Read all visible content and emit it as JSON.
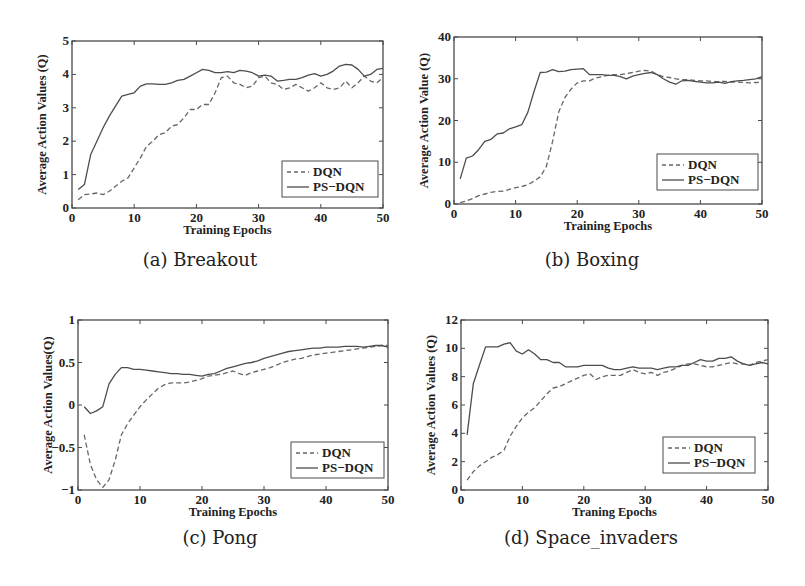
{
  "chart_data": [
    {
      "id": "a",
      "type": "line",
      "caption": "(a) Breakout",
      "title": "",
      "xlabel": "Training Epochs",
      "ylabel": "Average Action Values (Q)",
      "xlim": [
        0,
        50
      ],
      "ylim": [
        0,
        5
      ],
      "xticks": [
        0,
        10,
        20,
        30,
        40,
        50
      ],
      "yticks": [
        0,
        1,
        2,
        3,
        4,
        5
      ],
      "grid": false,
      "legend_position": "lower right",
      "frame": {
        "x": 72,
        "y": 41,
        "w": 311,
        "h": 167
      },
      "legend_box": {
        "x": 282,
        "y": 161,
        "w": 96,
        "h": 36
      },
      "x": [
        1,
        2,
        3,
        4,
        5,
        6,
        7,
        8,
        9,
        10,
        11,
        12,
        13,
        14,
        15,
        16,
        17,
        18,
        19,
        20,
        21,
        22,
        23,
        24,
        25,
        26,
        27,
        28,
        29,
        30,
        31,
        32,
        33,
        34,
        35,
        36,
        37,
        38,
        39,
        40,
        41,
        42,
        43,
        44,
        45,
        46,
        47,
        48,
        49,
        50
      ],
      "series": [
        {
          "name": "DQN",
          "style": "dashed",
          "values": [
            0.25,
            0.4,
            0.42,
            0.45,
            0.4,
            0.5,
            0.65,
            0.8,
            0.9,
            1.2,
            1.5,
            1.85,
            2.0,
            2.2,
            2.25,
            2.45,
            2.5,
            2.7,
            2.95,
            2.95,
            3.1,
            3.1,
            3.45,
            3.9,
            3.95,
            3.75,
            3.7,
            3.6,
            3.65,
            3.9,
            3.95,
            3.75,
            3.7,
            3.55,
            3.6,
            3.7,
            3.6,
            3.5,
            3.6,
            3.75,
            3.6,
            3.55,
            3.6,
            3.8,
            3.6,
            3.75,
            3.95,
            3.8,
            3.75,
            3.9
          ]
        },
        {
          "name": "PS-DQN",
          "style": "solid",
          "values": [
            0.55,
            0.7,
            1.6,
            2.0,
            2.4,
            2.75,
            3.05,
            3.35,
            3.4,
            3.45,
            3.65,
            3.72,
            3.72,
            3.7,
            3.7,
            3.75,
            3.82,
            3.85,
            3.95,
            4.05,
            4.15,
            4.12,
            4.05,
            4.05,
            4.08,
            4.05,
            4.12,
            4.1,
            4.05,
            3.95,
            3.98,
            3.95,
            3.8,
            3.82,
            3.85,
            3.85,
            3.9,
            3.98,
            4.02,
            3.95,
            4.0,
            4.1,
            4.25,
            4.3,
            4.28,
            4.15,
            3.95,
            4.0,
            4.15,
            4.18
          ]
        }
      ]
    },
    {
      "id": "b",
      "type": "line",
      "caption": "(b) Boxing",
      "title": "",
      "xlabel": "Training Epochs",
      "ylabel": "Average Action Value (Q)",
      "xlim": [
        0,
        50
      ],
      "ylim": [
        0,
        40
      ],
      "xticks": [
        0,
        10,
        20,
        30,
        40,
        50
      ],
      "yticks": [
        0,
        10,
        20,
        30,
        40
      ],
      "grid": false,
      "legend_position": "lower right",
      "frame": {
        "x": 454,
        "y": 37,
        "w": 308,
        "h": 167
      },
      "legend_box": {
        "x": 657,
        "y": 154,
        "w": 101,
        "h": 36
      },
      "x": [
        1,
        2,
        3,
        4,
        5,
        6,
        7,
        8,
        9,
        10,
        11,
        12,
        13,
        14,
        15,
        16,
        17,
        18,
        19,
        20,
        21,
        22,
        23,
        24,
        25,
        26,
        27,
        28,
        29,
        30,
        31,
        32,
        33,
        34,
        35,
        36,
        37,
        38,
        39,
        40,
        41,
        42,
        43,
        44,
        45,
        46,
        47,
        48,
        49,
        50
      ],
      "series": [
        {
          "name": "DQN",
          "style": "dashed",
          "values": [
            0.3,
            0.7,
            1.3,
            2.0,
            2.4,
            2.8,
            3.0,
            3.1,
            3.5,
            3.9,
            4.2,
            4.6,
            5.5,
            6.5,
            9.0,
            15.0,
            22.0,
            25.5,
            27.5,
            29.0,
            29.5,
            29.5,
            30.2,
            30.5,
            30.8,
            31.0,
            31.0,
            31.2,
            31.5,
            31.8,
            32.0,
            31.8,
            31.0,
            30.5,
            30.3,
            30.0,
            29.8,
            29.8,
            29.6,
            29.5,
            29.5,
            29.3,
            29.3,
            29.4,
            29.2,
            29.2,
            29.1,
            29.0,
            29.1,
            29.2
          ]
        },
        {
          "name": "PS-DQN",
          "style": "solid",
          "values": [
            6.0,
            11.0,
            11.5,
            13.0,
            15.0,
            15.5,
            16.8,
            17.0,
            18.0,
            18.5,
            19.0,
            22.0,
            27.0,
            31.5,
            31.6,
            32.2,
            31.7,
            31.8,
            32.2,
            32.3,
            32.4,
            31.0,
            31.0,
            31.0,
            30.8,
            30.8,
            30.5,
            30.0,
            30.6,
            31.0,
            31.3,
            31.5,
            31.0,
            30.0,
            29.2,
            28.7,
            29.5,
            29.6,
            29.4,
            29.2,
            29.0,
            29.0,
            29.2,
            28.9,
            29.3,
            29.5,
            29.6,
            29.8,
            30.0,
            30.5
          ]
        }
      ]
    },
    {
      "id": "c",
      "type": "line",
      "caption": "(c) Pong",
      "title": "",
      "xlabel": "Training Epochs",
      "ylabel": "Average Action Values(Q)",
      "xlim": [
        0,
        50
      ],
      "ylim": [
        -1,
        1
      ],
      "xticks": [
        0,
        10,
        20,
        30,
        40,
        50
      ],
      "yticks": [
        -1,
        -0.5,
        0,
        0.5,
        1
      ],
      "ytick_labels": [
        "−1",
        "−0.5",
        "0",
        "0.5",
        "1"
      ],
      "grid": false,
      "legend_position": "lower right",
      "frame": {
        "x": 78,
        "y": 320,
        "w": 310,
        "h": 170
      },
      "legend_box": {
        "x": 291,
        "y": 442,
        "w": 93,
        "h": 36
      },
      "x": [
        1,
        2,
        3,
        4,
        5,
        6,
        7,
        8,
        9,
        10,
        11,
        12,
        13,
        14,
        15,
        16,
        17,
        18,
        19,
        20,
        21,
        22,
        23,
        24,
        25,
        26,
        27,
        28,
        29,
        30,
        31,
        32,
        33,
        34,
        35,
        36,
        37,
        38,
        39,
        40,
        41,
        42,
        43,
        44,
        45,
        46,
        47,
        48,
        49,
        50
      ],
      "series": [
        {
          "name": "DQN",
          "style": "dashed",
          "values": [
            -0.35,
            -0.7,
            -0.88,
            -0.97,
            -0.88,
            -0.65,
            -0.35,
            -0.22,
            -0.12,
            -0.02,
            0.06,
            0.13,
            0.2,
            0.24,
            0.26,
            0.26,
            0.26,
            0.27,
            0.29,
            0.31,
            0.34,
            0.35,
            0.36,
            0.38,
            0.4,
            0.37,
            0.35,
            0.38,
            0.4,
            0.42,
            0.44,
            0.47,
            0.5,
            0.52,
            0.54,
            0.55,
            0.57,
            0.59,
            0.6,
            0.61,
            0.62,
            0.63,
            0.64,
            0.65,
            0.66,
            0.67,
            0.68,
            0.69,
            0.7,
            0.7
          ]
        },
        {
          "name": "PS-DQN",
          "style": "solid",
          "values": [
            -0.02,
            -0.1,
            -0.07,
            -0.02,
            0.25,
            0.36,
            0.44,
            0.44,
            0.42,
            0.42,
            0.41,
            0.4,
            0.39,
            0.38,
            0.37,
            0.37,
            0.36,
            0.36,
            0.35,
            0.34,
            0.36,
            0.37,
            0.4,
            0.43,
            0.45,
            0.47,
            0.49,
            0.5,
            0.52,
            0.55,
            0.57,
            0.59,
            0.61,
            0.63,
            0.64,
            0.65,
            0.66,
            0.67,
            0.67,
            0.68,
            0.68,
            0.68,
            0.69,
            0.69,
            0.69,
            0.68,
            0.69,
            0.7,
            0.7,
            0.68
          ]
        }
      ]
    },
    {
      "id": "d",
      "type": "line",
      "caption": "(d) Space_invaders",
      "title": "",
      "xlabel": "Traning Epochs",
      "ylabel": "Average Action Values (Q)",
      "xlim": [
        0,
        50
      ],
      "ylim": [
        0,
        12
      ],
      "xticks": [
        0,
        10,
        20,
        30,
        40,
        50
      ],
      "yticks": [
        0,
        2,
        4,
        6,
        8,
        10,
        12
      ],
      "grid": false,
      "legend_position": "lower right",
      "frame": {
        "x": 461,
        "y": 320,
        "w": 307,
        "h": 170
      },
      "legend_box": {
        "x": 663,
        "y": 437,
        "w": 92,
        "h": 36
      },
      "x": [
        1,
        2,
        3,
        4,
        5,
        6,
        7,
        8,
        9,
        10,
        11,
        12,
        13,
        14,
        15,
        16,
        17,
        18,
        19,
        20,
        21,
        22,
        23,
        24,
        25,
        26,
        27,
        28,
        29,
        30,
        31,
        32,
        33,
        34,
        35,
        36,
        37,
        38,
        39,
        40,
        41,
        42,
        43,
        44,
        45,
        46,
        47,
        48,
        49,
        50
      ],
      "series": [
        {
          "name": "DQN",
          "style": "dashed",
          "values": [
            0.7,
            1.3,
            1.7,
            2.0,
            2.3,
            2.5,
            2.8,
            3.8,
            4.5,
            5.1,
            5.5,
            5.8,
            6.3,
            6.8,
            7.2,
            7.3,
            7.5,
            7.7,
            7.9,
            8.1,
            8.2,
            7.8,
            8.0,
            8.1,
            8.1,
            8.1,
            8.3,
            8.5,
            8.3,
            8.2,
            8.3,
            8.1,
            8.3,
            8.4,
            8.6,
            8.8,
            8.9,
            8.9,
            8.8,
            8.7,
            8.7,
            8.8,
            8.9,
            9.0,
            8.9,
            8.9,
            8.8,
            9.0,
            9.1,
            9.2
          ]
        },
        {
          "name": "PS-DQN",
          "style": "solid",
          "values": [
            3.9,
            7.5,
            8.8,
            10.1,
            10.1,
            10.1,
            10.3,
            10.4,
            9.8,
            9.6,
            9.9,
            9.6,
            9.2,
            9.2,
            9.0,
            9.0,
            8.7,
            8.7,
            8.7,
            8.8,
            8.8,
            8.8,
            8.8,
            8.6,
            8.5,
            8.5,
            8.6,
            8.7,
            8.6,
            8.6,
            8.6,
            8.5,
            8.6,
            8.7,
            8.7,
            8.8,
            8.8,
            9.0,
            9.2,
            9.1,
            9.1,
            9.3,
            9.3,
            9.4,
            9.1,
            8.9,
            8.8,
            8.9,
            9.0,
            8.9
          ]
        }
      ]
    }
  ],
  "legend": {
    "dqn_label": "DQN",
    "psdqn_label": "PS−DQN"
  },
  "colors": {
    "axis": "#4a4a4a",
    "dqn": "#666666",
    "psdqn": "#4d4d4d",
    "text": "#222222"
  }
}
